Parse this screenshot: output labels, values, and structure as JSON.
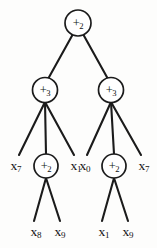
{
  "figure": {
    "type": "expression-tree",
    "background_color": "#fdfdfc",
    "stroke_color": "#1b1b1b"
  },
  "nodes": [
    {
      "id": "root",
      "operator": "+",
      "subscript": "2",
      "cx": 78,
      "cy": 23,
      "r": 13
    },
    {
      "id": "left-mid",
      "operator": "+",
      "subscript": "3",
      "cx": 45,
      "cy": 90,
      "r": 12.5
    },
    {
      "id": "right-mid",
      "operator": "+",
      "subscript": "3",
      "cx": 111,
      "cy": 90,
      "r": 12.5
    },
    {
      "id": "left-low",
      "operator": "+",
      "subscript": "2",
      "cx": 46,
      "cy": 166,
      "r": 12
    },
    {
      "id": "right-low",
      "operator": "+",
      "subscript": "2",
      "cx": 114,
      "cy": 166,
      "r": 12
    }
  ],
  "leaves": [
    {
      "id": "leaf-x7-left",
      "variable": "x",
      "subscript": "7",
      "cx": 16,
      "cy": 166
    },
    {
      "id": "leaf-x1-left",
      "variable": "x",
      "subscript": "1",
      "cx": 76,
      "cy": 166
    },
    {
      "id": "leaf-x0-right",
      "variable": "x",
      "subscript": "0",
      "cx": 85,
      "cy": 166
    },
    {
      "id": "leaf-x7-right",
      "variable": "x",
      "subscript": "7",
      "cx": 144,
      "cy": 166
    },
    {
      "id": "leaf-x8",
      "variable": "x",
      "subscript": "8",
      "cx": 36,
      "cy": 232
    },
    {
      "id": "leaf-x9-left",
      "variable": "x",
      "subscript": "9",
      "cx": 60,
      "cy": 232
    },
    {
      "id": "leaf-x1-bot",
      "variable": "x",
      "subscript": "1",
      "cx": 104,
      "cy": 232
    },
    {
      "id": "leaf-x9-right",
      "variable": "x",
      "subscript": "9",
      "cx": 128,
      "cy": 232
    }
  ],
  "edges": [
    {
      "from": "root",
      "to": "left-mid",
      "x1": 73,
      "y1": 34,
      "x2": 48,
      "y2": 79
    },
    {
      "from": "root",
      "to": "right-mid",
      "x1": 83,
      "y1": 34,
      "x2": 108,
      "y2": 79
    },
    {
      "from": "left-mid",
      "to": "leaf-x7-left",
      "x1": 45,
      "y1": 102,
      "x2": 19,
      "y2": 155
    },
    {
      "from": "left-mid",
      "to": "left-low",
      "x1": 45,
      "y1": 102,
      "x2": 46,
      "y2": 154
    },
    {
      "from": "left-mid",
      "to": "leaf-x1-left",
      "x1": 45,
      "y1": 102,
      "x2": 74,
      "y2": 155
    },
    {
      "from": "right-mid",
      "to": "leaf-x0-right",
      "x1": 111,
      "y1": 102,
      "x2": 87,
      "y2": 155
    },
    {
      "from": "right-mid",
      "to": "right-low",
      "x1": 111,
      "y1": 102,
      "x2": 114,
      "y2": 154
    },
    {
      "from": "right-mid",
      "to": "leaf-x7-right",
      "x1": 111,
      "y1": 102,
      "x2": 141,
      "y2": 155
    },
    {
      "from": "left-low",
      "to": "leaf-x8",
      "x1": 46,
      "y1": 178,
      "x2": 34,
      "y2": 221
    },
    {
      "from": "left-low",
      "to": "leaf-x9-left",
      "x1": 46,
      "y1": 178,
      "x2": 60,
      "y2": 221
    },
    {
      "from": "right-low",
      "to": "leaf-x1-bot",
      "x1": 114,
      "y1": 178,
      "x2": 102,
      "y2": 221
    },
    {
      "from": "right-low",
      "to": "leaf-x9-right",
      "x1": 114,
      "y1": 178,
      "x2": 128,
      "y2": 221
    }
  ]
}
